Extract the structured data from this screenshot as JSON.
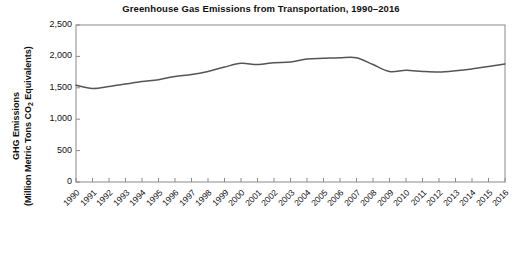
{
  "chart_data": {
    "type": "line",
    "title": "Greenhouse Gas Emissions from Transportation, 1990–2016",
    "xlabel": "",
    "ylabel_line1": "GHG Emissions",
    "ylabel_line2_pre": "(Million Metric Tons CO",
    "ylabel_line2_sub": "2",
    "ylabel_line2_post": " Equivalents)",
    "ylabel_plain": "GHG Emissions (Million Metric Tons CO2 Equivalents)",
    "categories": [
      "1990",
      "1991",
      "1992",
      "1993",
      "1994",
      "1995",
      "1996",
      "1997",
      "1998",
      "1999",
      "2000",
      "2001",
      "2002",
      "2003",
      "2004",
      "2005",
      "2006",
      "2007",
      "2008",
      "2009",
      "2010",
      "2011",
      "2012",
      "2013",
      "2014",
      "2015",
      "2016"
    ],
    "values": [
      1540,
      1490,
      1520,
      1560,
      1600,
      1630,
      1680,
      1710,
      1760,
      1830,
      1890,
      1870,
      1900,
      1910,
      1960,
      1970,
      1980,
      1980,
      1870,
      1760,
      1780,
      1760,
      1750,
      1770,
      1800,
      1840,
      1880
    ],
    "ylim": [
      0,
      2500
    ],
    "ytick_values": [
      0,
      500,
      1000,
      1500,
      2000,
      2500
    ],
    "ytick_labels": [
      "0",
      "500",
      "1,000",
      "1,500",
      "2,000",
      "2,500"
    ],
    "grid": false,
    "legend": "none",
    "line_color": "#555555",
    "axis_color": "#8a8a8a",
    "background": "#ffffff"
  }
}
